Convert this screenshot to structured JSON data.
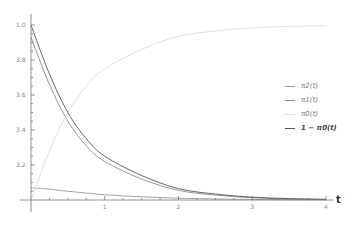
{
  "chart_data": {
    "type": "line",
    "title": "",
    "xlabel": "t",
    "ylabel": "",
    "xlim": [
      0,
      4
    ],
    "ylim": [
      0,
      1.05
    ],
    "x_ticks": [
      "1",
      "2",
      "3",
      "4"
    ],
    "y_ticks": [
      "1.0",
      "3.8",
      "3.6",
      "3.4",
      "3.2"
    ],
    "grid": false,
    "legend_position": "right",
    "x": [
      0,
      0.25,
      0.5,
      0.75,
      1.0,
      1.5,
      2.0,
      2.5,
      3.0,
      3.5,
      4.0
    ],
    "series": [
      {
        "name": "π2(t)",
        "color": "#9a9a9a",
        "values": [
          0.07,
          0.062,
          0.05,
          0.04,
          0.03,
          0.018,
          0.01,
          0.006,
          0.003,
          0.002,
          0.001
        ]
      },
      {
        "name": "π1(t)",
        "color": "#8c8c8c",
        "values": [
          0.93,
          0.66,
          0.45,
          0.31,
          0.22,
          0.12,
          0.055,
          0.028,
          0.013,
          0.006,
          0.003
        ]
      },
      {
        "name": "π0(t)",
        "color": "#dddddd",
        "values": [
          0.0,
          0.28,
          0.5,
          0.65,
          0.75,
          0.86,
          0.935,
          0.966,
          0.984,
          0.992,
          0.996
        ]
      },
      {
        "name": "1 − π0(t)",
        "color": "#555555",
        "values": [
          1.0,
          0.72,
          0.5,
          0.35,
          0.25,
          0.14,
          0.065,
          0.034,
          0.016,
          0.008,
          0.004
        ]
      }
    ]
  },
  "legend": {
    "items": [
      {
        "label": "π2(t)",
        "color": "#9a9a9a"
      },
      {
        "label": "π1(t)",
        "color": "#8c8c8c"
      },
      {
        "label": "π0(t)",
        "color": "#dddddd"
      },
      {
        "label": "1 − π0(t)",
        "color": "#555555"
      }
    ]
  },
  "axis": {
    "x_label": "t"
  }
}
